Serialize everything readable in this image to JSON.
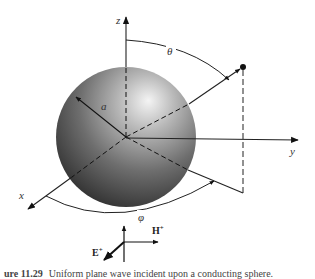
{
  "figure": {
    "axes": {
      "x_label": "x",
      "y_label": "y",
      "z_label": "z"
    },
    "angles": {
      "theta_label": "θ",
      "phi_label": "φ"
    },
    "sphere": {
      "radius_label": "a",
      "colors": {
        "highlight": "#f2f2f2",
        "mid": "#8a8a8a",
        "shadow": "#2e2e2e"
      }
    },
    "incident_wave": {
      "e_field_label": "E",
      "e_field_sup": "+",
      "h_field_label": "H",
      "h_field_sup": "+"
    }
  },
  "caption": {
    "number": "ure 11.29",
    "text": "Uniform plane wave incident upon a conducting sphere."
  }
}
